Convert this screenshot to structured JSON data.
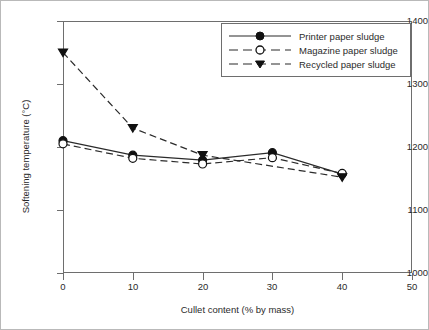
{
  "chart_data": {
    "type": "line",
    "title": "",
    "xlabel": "Cullet content (% by mass)",
    "ylabel": "Softening temperature (°C)",
    "x": [
      0,
      10,
      20,
      30,
      40
    ],
    "xlim": [
      0,
      50
    ],
    "ylim": [
      1000,
      1400
    ],
    "xticks": [
      "0",
      "10",
      "20",
      "30",
      "40",
      "50"
    ],
    "yticks": [
      "1000",
      "1100",
      "1200",
      "1300",
      "1400"
    ],
    "grid": false,
    "legend_position": "top-right",
    "series": [
      {
        "name": "Printer paper sludge",
        "marker": "filled-circle",
        "line": "solid",
        "values": [
          1210,
          1187,
          1179,
          1191,
          1157
        ]
      },
      {
        "name": "Magazine paper sludge",
        "marker": "open-circle",
        "line": "dashed",
        "values": [
          1205,
          1182,
          1173,
          1183,
          1158
        ]
      },
      {
        "name": "Recycled paper sludge",
        "marker": "filled-triangle-down",
        "line": "dashed",
        "values": [
          1350,
          1230,
          1187,
          null,
          1152
        ]
      }
    ]
  },
  "axes": {
    "y_tick_labels": [
      "1400",
      "1300",
      "1200",
      "1100",
      "1000"
    ],
    "x_tick_labels": [
      "0",
      "10",
      "20",
      "30",
      "40",
      "50"
    ],
    "x_title": "Cullet content (% by mass)",
    "y_title": "Softening temperature (°C)"
  },
  "legend": {
    "entries": [
      {
        "label": "Printer paper sludge"
      },
      {
        "label": "Magazine paper sludge"
      },
      {
        "label": "Recycled paper sludge"
      }
    ]
  },
  "colors": {
    "ink": "#2b2b2b",
    "axis": "#6e6e6e",
    "background": "#ffffff"
  }
}
